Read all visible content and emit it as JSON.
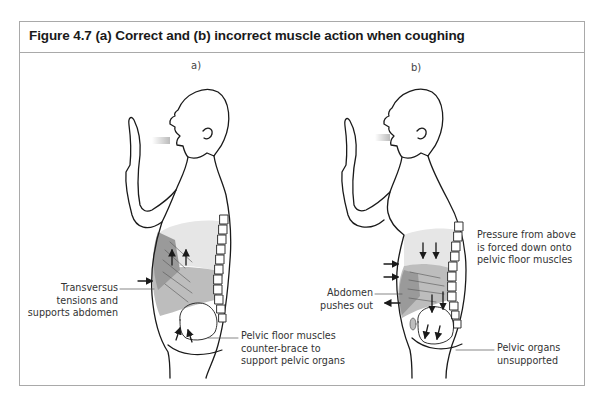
{
  "figure": {
    "title": "Figure 4.7  (a) Correct and (b) incorrect muscle action when coughing",
    "panels": [
      {
        "id": "a",
        "label": "a)",
        "annotations": [
          {
            "lines": [
              "Transversus",
              "tensions and",
              "supports abdomen"
            ]
          },
          {
            "lines": [
              "Pelvic floor muscles",
              "counter-brace to",
              "support pelvic organs"
            ]
          }
        ]
      },
      {
        "id": "b",
        "label": "b)",
        "annotations": [
          {
            "lines": [
              "Pressure from above",
              "is forced down onto",
              "pelvic floor muscles"
            ]
          },
          {
            "lines": [
              "Abdomen",
              "pushes out"
            ]
          },
          {
            "lines": [
              "Pelvic organs",
              "unsupported"
            ]
          }
        ]
      }
    ],
    "colors": {
      "frame": "#a9a9a9",
      "light_fill": "#e6e6e6",
      "mid_fill": "#bdbdbd",
      "dark_fill": "#9a9a9a",
      "line": "#1a1a1a"
    }
  }
}
